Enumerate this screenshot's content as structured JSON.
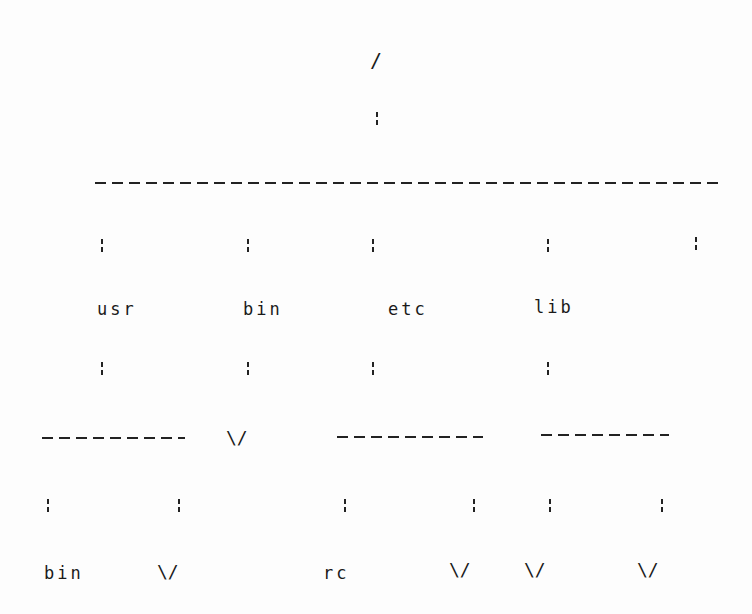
{
  "diagram": {
    "type": "directory-tree",
    "colors": {
      "background": "#fdfdfd",
      "ink": "#1a1a1a"
    },
    "root": {
      "label": "/"
    },
    "level1": [
      {
        "label": "usr"
      },
      {
        "label": "bin"
      },
      {
        "label": "etc"
      },
      {
        "label": "lib"
      },
      {
        "label": ""
      }
    ],
    "level2": {
      "usr": [
        {
          "label": "bin"
        },
        {
          "label": "\\/"
        }
      ],
      "bin": [
        {
          "label": "\\/"
        }
      ],
      "etc": [
        {
          "label": "rc"
        },
        {
          "label": "\\/"
        }
      ],
      "lib": [
        {
          "label": "\\/"
        },
        {
          "label": "\\/"
        }
      ]
    },
    "symbols": {
      "connector": "¦",
      "empty_marker": "\\/"
    }
  }
}
